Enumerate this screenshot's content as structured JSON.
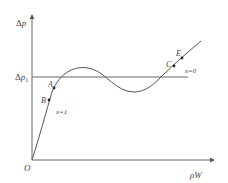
{
  "diagram": {
    "type": "characteristic-curve",
    "axes": {
      "y_label_delta": "Δ",
      "y_label_var": "p",
      "x_label": "ρW",
      "origin_label": "O"
    },
    "reference_line": {
      "label_delta": "Δ",
      "label_var": "p",
      "label_sub": "1"
    },
    "points": {
      "A": "A",
      "B": "B",
      "C": "C",
      "E": "E"
    },
    "annotations": {
      "x1": "x=1",
      "x0": "x=0"
    },
    "colors": {
      "line": "#555555",
      "text": "#444444",
      "point": "#222222"
    }
  }
}
